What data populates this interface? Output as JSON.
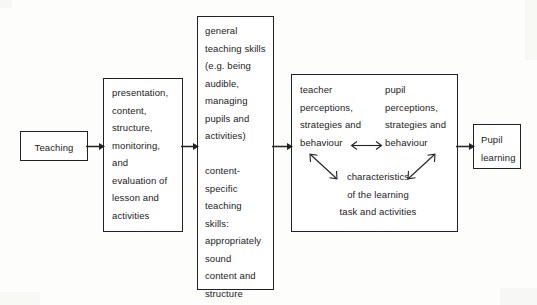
{
  "diagram": {
    "type": "flowchart",
    "orientation": "left-to-right",
    "nodes": [
      {
        "id": "teaching",
        "label": "Teaching",
        "align": "center"
      },
      {
        "id": "teaching-acts",
        "label": "presentation,\ncontent,\nstructure,\nmonitoring,\nand\nevaluation of\nlesson and\nactivities",
        "align": "left"
      },
      {
        "id": "teaching-skills",
        "label": "general\nteaching skills\n(e.g. being\naudible,\nmanaging\npupils and\nactivities)\n\ncontent-\nspecific\nteaching\nskills:\nappropriately\nsound\ncontent and\nstructure",
        "align": "left"
      },
      {
        "id": "classroom-processes",
        "teacher_column": "teacher\nperceptions,\nstrategies and\nbehaviour",
        "pupil_column": "pupil\nperceptions,\nstrategies and\nbehaviour",
        "characteristics": "characteristics\nof the learning\ntask and activities",
        "align": "left"
      },
      {
        "id": "pupil-learning",
        "label": "Pupil\nlearning",
        "align": "left"
      }
    ],
    "connectors": [
      {
        "id": "teaching-to-activities",
        "kind": "arrow-right"
      },
      {
        "id": "activities-to-skills",
        "kind": "arrow-right"
      },
      {
        "id": "skills-to-processes",
        "kind": "arrow-right"
      },
      {
        "id": "processes-to-learning",
        "kind": "arrow-right"
      },
      {
        "id": "teacher-pupil-link",
        "kind": "arrow-both-horizontal"
      },
      {
        "id": "teacher-characteristics-link",
        "kind": "arrow-both-diagonal"
      },
      {
        "id": "pupil-characteristics-link",
        "kind": "arrow-both-diagonal"
      }
    ],
    "colors": {
      "stroke": "#222222",
      "text": "#1b1b1b",
      "background": "#fdfdfc",
      "box_fill": "#ffffff"
    }
  }
}
